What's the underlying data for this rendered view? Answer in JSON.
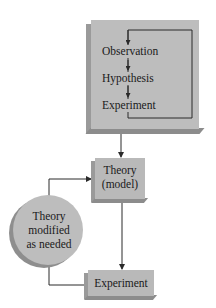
{
  "diagram": {
    "type": "flowchart",
    "method_box": {
      "steps": [
        {
          "label": "Observation"
        },
        {
          "label": "Hypothesis"
        },
        {
          "label": "Experiment"
        }
      ]
    },
    "theory_box": {
      "line1": "Theory",
      "line2": "(model)"
    },
    "modify_circle": {
      "line1": "Theory",
      "line2": "modified",
      "line3": "as needed"
    },
    "experiment_box": {
      "label": "Experiment"
    },
    "edges": [
      {
        "from": "Observation",
        "to": "Hypothesis"
      },
      {
        "from": "Hypothesis",
        "to": "Experiment"
      },
      {
        "from": "Experiment",
        "to": "Observation",
        "kind": "loop"
      },
      {
        "from": "method_box",
        "to": "Theory (model)"
      },
      {
        "from": "Theory (model)",
        "to": "Experiment"
      },
      {
        "from": "Experiment",
        "to": "Theory modified as needed"
      },
      {
        "from": "Theory modified as needed",
        "to": "Theory (model)"
      }
    ],
    "colors": {
      "box_fill": "#b9b9b9",
      "bevel_dark": "#8c8c8c",
      "line": "#2a2a2a",
      "background": "#ffffff"
    }
  }
}
